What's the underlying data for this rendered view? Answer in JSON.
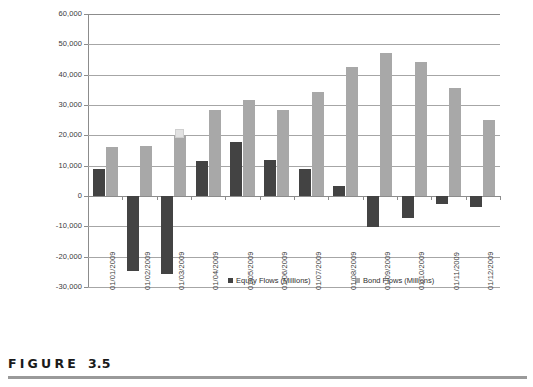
{
  "figure": {
    "label_word": "FIGURE",
    "number": "3.5"
  },
  "chart_data": {
    "type": "bar",
    "title": "",
    "subtitle": "",
    "xlabel": "",
    "ylabel": "",
    "ylim": [
      -30000,
      60000
    ],
    "ytick_step": 10000,
    "grid": true,
    "legend_position": "inside-bottom-center",
    "categories": [
      "01/01/2009",
      "01/02/2009",
      "01/03/2009",
      "01/04/2009",
      "01/05/2009",
      "01/06/2009",
      "01/07/2009",
      "01/08/2009",
      "01/09/2009",
      "01/10/2009",
      "01/11/2009",
      "01/12/2009"
    ],
    "ytick_labels": [
      "60,000",
      "50,000",
      "40,000",
      "30,000",
      "20,000",
      "10,000",
      "0",
      "-10,000",
      "-20,000",
      "-30,000"
    ],
    "series": [
      {
        "name": "Equity Flows (Millions)",
        "color": "#434343",
        "values": [
          9000,
          -24800,
          -25700,
          11600,
          17900,
          11800,
          8800,
          3400,
          -10300,
          -7300,
          -2500,
          -3500
        ]
      },
      {
        "name": "Bond Flows (Millions)",
        "color": "#a8a8a8",
        "values": [
          16300,
          16600,
          19800,
          28200,
          31500,
          28500,
          34400,
          42400,
          47000,
          44200,
          35500,
          25200
        ]
      }
    ]
  }
}
